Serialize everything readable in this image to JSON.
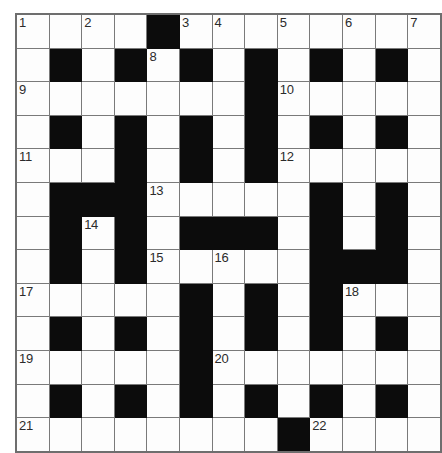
{
  "puzzle": {
    "title": "Crossword Grid",
    "rows": 13,
    "cols": 13,
    "cell_size_px": 31.6,
    "colors": {
      "block": "#0c0c0c",
      "cell": "#fdfdfd",
      "grid_line": "#7a7a7a",
      "outer_border": "#6e6e6e",
      "number_text": "#2b2b2b"
    },
    "clue_numbers_present": [
      1,
      2,
      3,
      4,
      5,
      6,
      7,
      8,
      9,
      10,
      11,
      12,
      13,
      14,
      15,
      16,
      17,
      18,
      19,
      20,
      21,
      22
    ],
    "grid": [
      [
        {
          "block": false,
          "num": "1"
        },
        {
          "block": false,
          "num": ""
        },
        {
          "block": false,
          "num": "2"
        },
        {
          "block": false,
          "num": ""
        },
        {
          "block": true,
          "num": ""
        },
        {
          "block": false,
          "num": "3"
        },
        {
          "block": false,
          "num": "4"
        },
        {
          "block": false,
          "num": ""
        },
        {
          "block": false,
          "num": "5"
        },
        {
          "block": false,
          "num": ""
        },
        {
          "block": false,
          "num": "6"
        },
        {
          "block": false,
          "num": ""
        },
        {
          "block": false,
          "num": "7"
        }
      ],
      [
        {
          "block": false,
          "num": ""
        },
        {
          "block": true,
          "num": ""
        },
        {
          "block": false,
          "num": ""
        },
        {
          "block": true,
          "num": ""
        },
        {
          "block": false,
          "num": "8"
        },
        {
          "block": true,
          "num": ""
        },
        {
          "block": false,
          "num": ""
        },
        {
          "block": true,
          "num": ""
        },
        {
          "block": false,
          "num": ""
        },
        {
          "block": true,
          "num": ""
        },
        {
          "block": false,
          "num": ""
        },
        {
          "block": true,
          "num": ""
        },
        {
          "block": false,
          "num": ""
        }
      ],
      [
        {
          "block": false,
          "num": "9"
        },
        {
          "block": false,
          "num": ""
        },
        {
          "block": false,
          "num": ""
        },
        {
          "block": false,
          "num": ""
        },
        {
          "block": false,
          "num": ""
        },
        {
          "block": false,
          "num": ""
        },
        {
          "block": false,
          "num": ""
        },
        {
          "block": true,
          "num": ""
        },
        {
          "block": false,
          "num": "10"
        },
        {
          "block": false,
          "num": ""
        },
        {
          "block": false,
          "num": ""
        },
        {
          "block": false,
          "num": ""
        },
        {
          "block": false,
          "num": ""
        }
      ],
      [
        {
          "block": false,
          "num": ""
        },
        {
          "block": true,
          "num": ""
        },
        {
          "block": false,
          "num": ""
        },
        {
          "block": true,
          "num": ""
        },
        {
          "block": false,
          "num": ""
        },
        {
          "block": true,
          "num": ""
        },
        {
          "block": false,
          "num": ""
        },
        {
          "block": true,
          "num": ""
        },
        {
          "block": false,
          "num": ""
        },
        {
          "block": true,
          "num": ""
        },
        {
          "block": false,
          "num": ""
        },
        {
          "block": true,
          "num": ""
        },
        {
          "block": false,
          "num": ""
        }
      ],
      [
        {
          "block": false,
          "num": "11"
        },
        {
          "block": false,
          "num": ""
        },
        {
          "block": false,
          "num": ""
        },
        {
          "block": true,
          "num": ""
        },
        {
          "block": false,
          "num": ""
        },
        {
          "block": true,
          "num": ""
        },
        {
          "block": false,
          "num": ""
        },
        {
          "block": true,
          "num": ""
        },
        {
          "block": false,
          "num": "12"
        },
        {
          "block": false,
          "num": ""
        },
        {
          "block": false,
          "num": ""
        },
        {
          "block": false,
          "num": ""
        },
        {
          "block": false,
          "num": ""
        }
      ],
      [
        {
          "block": false,
          "num": ""
        },
        {
          "block": true,
          "num": ""
        },
        {
          "block": true,
          "num": ""
        },
        {
          "block": true,
          "num": ""
        },
        {
          "block": false,
          "num": "13"
        },
        {
          "block": false,
          "num": ""
        },
        {
          "block": false,
          "num": ""
        },
        {
          "block": false,
          "num": ""
        },
        {
          "block": false,
          "num": ""
        },
        {
          "block": true,
          "num": ""
        },
        {
          "block": false,
          "num": ""
        },
        {
          "block": true,
          "num": ""
        },
        {
          "block": false,
          "num": ""
        }
      ],
      [
        {
          "block": false,
          "num": ""
        },
        {
          "block": true,
          "num": ""
        },
        {
          "block": false,
          "num": "14"
        },
        {
          "block": true,
          "num": ""
        },
        {
          "block": false,
          "num": ""
        },
        {
          "block": true,
          "num": ""
        },
        {
          "block": true,
          "num": ""
        },
        {
          "block": true,
          "num": ""
        },
        {
          "block": false,
          "num": ""
        },
        {
          "block": true,
          "num": ""
        },
        {
          "block": false,
          "num": ""
        },
        {
          "block": true,
          "num": ""
        },
        {
          "block": false,
          "num": ""
        }
      ],
      [
        {
          "block": false,
          "num": ""
        },
        {
          "block": true,
          "num": ""
        },
        {
          "block": false,
          "num": ""
        },
        {
          "block": true,
          "num": ""
        },
        {
          "block": false,
          "num": "15"
        },
        {
          "block": false,
          "num": ""
        },
        {
          "block": false,
          "num": "16"
        },
        {
          "block": false,
          "num": ""
        },
        {
          "block": false,
          "num": ""
        },
        {
          "block": true,
          "num": ""
        },
        {
          "block": true,
          "num": ""
        },
        {
          "block": true,
          "num": ""
        },
        {
          "block": false,
          "num": ""
        }
      ],
      [
        {
          "block": false,
          "num": "17"
        },
        {
          "block": false,
          "num": ""
        },
        {
          "block": false,
          "num": ""
        },
        {
          "block": false,
          "num": ""
        },
        {
          "block": false,
          "num": ""
        },
        {
          "block": true,
          "num": ""
        },
        {
          "block": false,
          "num": ""
        },
        {
          "block": true,
          "num": ""
        },
        {
          "block": false,
          "num": ""
        },
        {
          "block": true,
          "num": ""
        },
        {
          "block": false,
          "num": "18"
        },
        {
          "block": false,
          "num": ""
        },
        {
          "block": false,
          "num": ""
        }
      ],
      [
        {
          "block": false,
          "num": ""
        },
        {
          "block": true,
          "num": ""
        },
        {
          "block": false,
          "num": ""
        },
        {
          "block": true,
          "num": ""
        },
        {
          "block": false,
          "num": ""
        },
        {
          "block": true,
          "num": ""
        },
        {
          "block": false,
          "num": ""
        },
        {
          "block": true,
          "num": ""
        },
        {
          "block": false,
          "num": ""
        },
        {
          "block": true,
          "num": ""
        },
        {
          "block": false,
          "num": ""
        },
        {
          "block": true,
          "num": ""
        },
        {
          "block": false,
          "num": ""
        }
      ],
      [
        {
          "block": false,
          "num": "19"
        },
        {
          "block": false,
          "num": ""
        },
        {
          "block": false,
          "num": ""
        },
        {
          "block": false,
          "num": ""
        },
        {
          "block": false,
          "num": ""
        },
        {
          "block": true,
          "num": ""
        },
        {
          "block": false,
          "num": "20"
        },
        {
          "block": false,
          "num": ""
        },
        {
          "block": false,
          "num": ""
        },
        {
          "block": false,
          "num": ""
        },
        {
          "block": false,
          "num": ""
        },
        {
          "block": false,
          "num": ""
        },
        {
          "block": false,
          "num": ""
        }
      ],
      [
        {
          "block": false,
          "num": ""
        },
        {
          "block": true,
          "num": ""
        },
        {
          "block": false,
          "num": ""
        },
        {
          "block": true,
          "num": ""
        },
        {
          "block": false,
          "num": ""
        },
        {
          "block": true,
          "num": ""
        },
        {
          "block": false,
          "num": ""
        },
        {
          "block": true,
          "num": ""
        },
        {
          "block": false,
          "num": ""
        },
        {
          "block": true,
          "num": ""
        },
        {
          "block": false,
          "num": ""
        },
        {
          "block": true,
          "num": ""
        },
        {
          "block": false,
          "num": ""
        }
      ],
      [
        {
          "block": false,
          "num": "21"
        },
        {
          "block": false,
          "num": ""
        },
        {
          "block": false,
          "num": ""
        },
        {
          "block": false,
          "num": ""
        },
        {
          "block": false,
          "num": ""
        },
        {
          "block": false,
          "num": ""
        },
        {
          "block": false,
          "num": ""
        },
        {
          "block": false,
          "num": ""
        },
        {
          "block": true,
          "num": ""
        },
        {
          "block": false,
          "num": "22"
        },
        {
          "block": false,
          "num": ""
        },
        {
          "block": false,
          "num": ""
        },
        {
          "block": false,
          "num": ""
        }
      ]
    ]
  }
}
